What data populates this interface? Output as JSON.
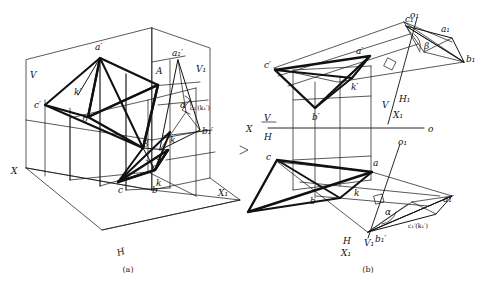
{
  "figure": {
    "captions": {
      "a": "(a)",
      "b": "(b)"
    }
  },
  "diagram_a": {
    "name": "pictorial-axonometric-view",
    "planes": [
      {
        "id": "V",
        "label": "V"
      },
      {
        "id": "V1",
        "label": "V₁"
      },
      {
        "id": "H",
        "label": "H"
      }
    ],
    "axes": [
      {
        "id": "X",
        "label": "X"
      },
      {
        "id": "X1",
        "label": "X₁"
      }
    ],
    "points": [
      {
        "id": "A",
        "label": "A"
      },
      {
        "id": "B",
        "label": "B"
      },
      {
        "id": "a_prime",
        "label": "a′"
      },
      {
        "id": "b_prime",
        "label": "b′"
      },
      {
        "id": "c_prime",
        "label": "c′"
      },
      {
        "id": "k_prime",
        "label": "k′"
      },
      {
        "id": "a",
        "label": "a"
      },
      {
        "id": "b",
        "label": "b"
      },
      {
        "id": "c",
        "label": "c"
      },
      {
        "id": "k",
        "label": "k"
      },
      {
        "id": "a1_prime",
        "label": "a₁′"
      },
      {
        "id": "b1_prime",
        "label": "b₁′"
      },
      {
        "id": "c1k1",
        "label": "c₁′(k₁′)"
      },
      {
        "id": "alpha_a",
        "label": "α"
      },
      {
        "id": "alpha_b",
        "label": "α"
      },
      {
        "id": "k_low",
        "label": "k"
      },
      {
        "id": "c_low",
        "label": "c"
      }
    ]
  },
  "diagram_b": {
    "name": "orthographic-projection-view",
    "axis_labels": [
      {
        "id": "X_main",
        "label": "X"
      },
      {
        "id": "V_over_H",
        "upper": "V",
        "lower": "H"
      },
      {
        "id": "O",
        "label": "o"
      },
      {
        "id": "V_upper",
        "label": "V"
      },
      {
        "id": "H1",
        "label": "H₁"
      },
      {
        "id": "X1_upper",
        "label": "X₁"
      },
      {
        "id": "H_lower",
        "label": "H"
      },
      {
        "id": "V1_lower",
        "label": "V₁"
      },
      {
        "id": "X1_lower",
        "label": "X₁"
      },
      {
        "id": "O1_upper",
        "label": "o₁"
      },
      {
        "id": "O1_lower",
        "label": "o₁"
      }
    ],
    "points": [
      {
        "id": "a_prime",
        "label": "a′"
      },
      {
        "id": "b_prime",
        "label": "b′"
      },
      {
        "id": "c_prime",
        "label": "c′"
      },
      {
        "id": "k_prime",
        "label": "k′"
      },
      {
        "id": "a",
        "label": "a"
      },
      {
        "id": "b",
        "label": "b"
      },
      {
        "id": "c",
        "label": "c"
      },
      {
        "id": "k",
        "label": "k"
      },
      {
        "id": "a1",
        "label": "a₁"
      },
      {
        "id": "b1",
        "label": "b₁"
      },
      {
        "id": "c1",
        "label": "c₁"
      },
      {
        "id": "a1_prime",
        "label": "a₁′"
      },
      {
        "id": "b1_prime",
        "label": "b₁′"
      },
      {
        "id": "c1k1",
        "label": "c₁′(k₁′)"
      }
    ],
    "angles": [
      {
        "id": "beta",
        "label": "β"
      },
      {
        "id": "alpha",
        "label": "α"
      }
    ]
  }
}
